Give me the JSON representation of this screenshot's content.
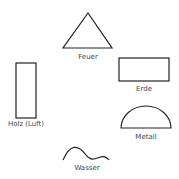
{
  "elements": [
    {
      "name": "Feuer",
      "shape": "triangle"
    },
    {
      "name": "Erde",
      "shape": "rectangle"
    },
    {
      "name": "Holz (Luft)",
      "shape": "tall-rectangle"
    },
    {
      "name": "Metall",
      "shape": "semicircle"
    },
    {
      "name": "Wasser",
      "shape": "wave"
    }
  ],
  "colors": {
    "stroke": "#222222",
    "text": "#444444",
    "background": "#ffffff"
  }
}
